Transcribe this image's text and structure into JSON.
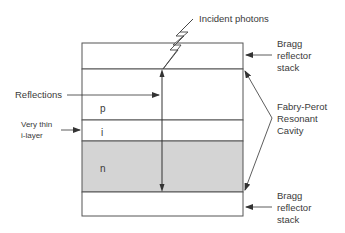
{
  "diagram": {
    "incident_label": "Incident photons",
    "reflections_label": "Reflections",
    "thin_layer_label": [
      "Very thin",
      "i-layer"
    ],
    "bragg_top_label": [
      "Bragg",
      "reflector",
      "stack"
    ],
    "bragg_bottom_label": [
      "Bragg",
      "reflector",
      "stack"
    ],
    "cavity_label": [
      "Fabry-Perot",
      "Resonant",
      "Cavity"
    ],
    "layers": [
      {
        "id": "bragg-top",
        "label": ""
      },
      {
        "id": "p",
        "label": "p"
      },
      {
        "id": "i",
        "label": "i"
      },
      {
        "id": "n",
        "label": "n"
      },
      {
        "id": "bragg-bottom",
        "label": ""
      }
    ],
    "colors": {
      "line": "#555555",
      "n_fill": "#d4d4d4",
      "text": "#3a3a3a"
    }
  }
}
